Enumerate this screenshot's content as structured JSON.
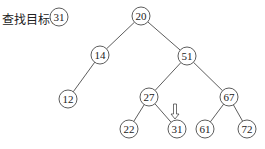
{
  "label": "查找目标：",
  "target": {
    "value": "31",
    "x": 59,
    "y": 17
  },
  "tree": {
    "nodes": [
      {
        "id": "n20",
        "value": "20",
        "x": 141,
        "y": 16
      },
      {
        "id": "n14",
        "value": "14",
        "x": 100,
        "y": 55
      },
      {
        "id": "n51",
        "value": "51",
        "x": 187,
        "y": 56
      },
      {
        "id": "n12",
        "value": "12",
        "x": 68,
        "y": 99
      },
      {
        "id": "n27",
        "value": "27",
        "x": 149,
        "y": 97
      },
      {
        "id": "n67",
        "value": "67",
        "x": 229,
        "y": 97
      },
      {
        "id": "n22",
        "value": "22",
        "x": 129,
        "y": 129
      },
      {
        "id": "n31",
        "value": "31",
        "x": 177,
        "y": 129
      },
      {
        "id": "n61",
        "value": "61",
        "x": 205,
        "y": 129
      },
      {
        "id": "n72",
        "value": "72",
        "x": 247,
        "y": 129
      }
    ],
    "edges": [
      [
        "n20",
        "n14"
      ],
      [
        "n20",
        "n51"
      ],
      [
        "n14",
        "n12"
      ],
      [
        "n51",
        "n27"
      ],
      [
        "n51",
        "n67"
      ],
      [
        "n27",
        "n22"
      ],
      [
        "n27",
        "n31"
      ],
      [
        "n67",
        "n61"
      ],
      [
        "n67",
        "n72"
      ]
    ]
  },
  "arrow": {
    "points_to": "n31",
    "x": 175,
    "y1": 104,
    "y2": 119
  },
  "colors": {
    "stroke": "#333333",
    "text": "#222222"
  }
}
